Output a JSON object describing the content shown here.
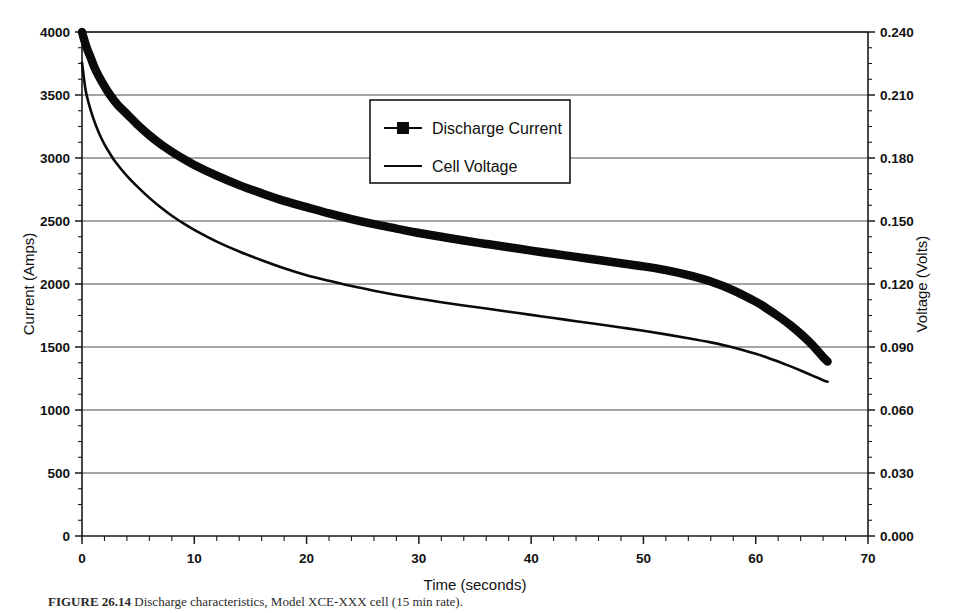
{
  "figure": {
    "caption_label": "FIGURE 26.14",
    "caption_text": "Discharge characteristics, Model XCE-XXX cell (15 min rate)."
  },
  "chart_data": {
    "type": "line",
    "title": "",
    "xlabel": "Time  (seconds)",
    "ylabel": "Current (Amps)",
    "y2label": "Voltage (Volts)",
    "xlim": [
      0,
      70
    ],
    "ylim": [
      0,
      4000
    ],
    "y2lim": [
      0.0,
      0.24
    ],
    "grid": "horizontal",
    "legend_position": "upper-center",
    "xticks": [
      "0",
      "10",
      "20",
      "30",
      "40",
      "50",
      "60",
      "70"
    ],
    "xtick_values": [
      0,
      10,
      20,
      30,
      40,
      50,
      60,
      70
    ],
    "xminor_step": 2,
    "yticks": [
      "0",
      "500",
      "1000",
      "1500",
      "2000",
      "2500",
      "3000",
      "3500",
      "4000"
    ],
    "ytick_values": [
      0,
      500,
      1000,
      1500,
      2000,
      2500,
      3000,
      3500,
      4000
    ],
    "yminor_step": 125,
    "y2ticks": [
      "0.000",
      "0.030",
      "0.060",
      "0.090",
      "0.120",
      "0.150",
      "0.180",
      "0.210",
      "0.240"
    ],
    "y2tick_values": [
      0.0,
      0.03,
      0.06,
      0.09,
      0.12,
      0.15,
      0.18,
      0.21,
      0.24
    ],
    "y2minor_step": 0.0075,
    "series": [
      {
        "name": "Discharge Current",
        "axis": "left",
        "marker": "square",
        "linewidth": "thick",
        "units": "Amps",
        "x": [
          0,
          0.4,
          0.8,
          1.2,
          1.8,
          2.5,
          3.2,
          4,
          5,
          6,
          7,
          8,
          9,
          10,
          12,
          14,
          16,
          18,
          20,
          22,
          24,
          26,
          28,
          30,
          32,
          34,
          36,
          38,
          40,
          42,
          44,
          46,
          48,
          50,
          52,
          54,
          56,
          58,
          60,
          61,
          62,
          63,
          64,
          65,
          66,
          66.4
        ],
        "y": [
          4000,
          3880,
          3790,
          3700,
          3600,
          3500,
          3420,
          3350,
          3260,
          3180,
          3110,
          3050,
          2995,
          2945,
          2860,
          2785,
          2720,
          2660,
          2610,
          2560,
          2515,
          2475,
          2440,
          2405,
          2375,
          2345,
          2318,
          2292,
          2265,
          2240,
          2215,
          2190,
          2165,
          2140,
          2110,
          2070,
          2020,
          1950,
          1860,
          1805,
          1745,
          1680,
          1605,
          1520,
          1420,
          1385
        ]
      },
      {
        "name": "Cell Voltage",
        "axis": "right",
        "marker": "none",
        "linewidth": "thin",
        "units": "Volts",
        "x": [
          0,
          0.3,
          0.6,
          1,
          1.5,
          2,
          2.5,
          3,
          4,
          5,
          6,
          7,
          8,
          9,
          10,
          12,
          14,
          16,
          18,
          20,
          22,
          24,
          26,
          28,
          30,
          32,
          34,
          36,
          38,
          40,
          42,
          44,
          46,
          48,
          50,
          52,
          54,
          56,
          58,
          60,
          61,
          62,
          63,
          64,
          65,
          66,
          66.4
        ],
        "y": [
          0.2255,
          0.213,
          0.206,
          0.199,
          0.192,
          0.1865,
          0.182,
          0.178,
          0.1715,
          0.166,
          0.161,
          0.1565,
          0.1525,
          0.149,
          0.1458,
          0.1402,
          0.1355,
          0.1313,
          0.1275,
          0.1242,
          0.1215,
          0.119,
          0.1168,
          0.1148,
          0.113,
          0.1113,
          0.1098,
          0.1083,
          0.1068,
          0.1053,
          0.1038,
          0.1023,
          0.1008,
          0.0993,
          0.0977,
          0.096,
          0.0942,
          0.0922,
          0.0898,
          0.0868,
          0.085,
          0.0831,
          0.081,
          0.0788,
          0.0765,
          0.0742,
          0.0735
        ]
      }
    ]
  }
}
